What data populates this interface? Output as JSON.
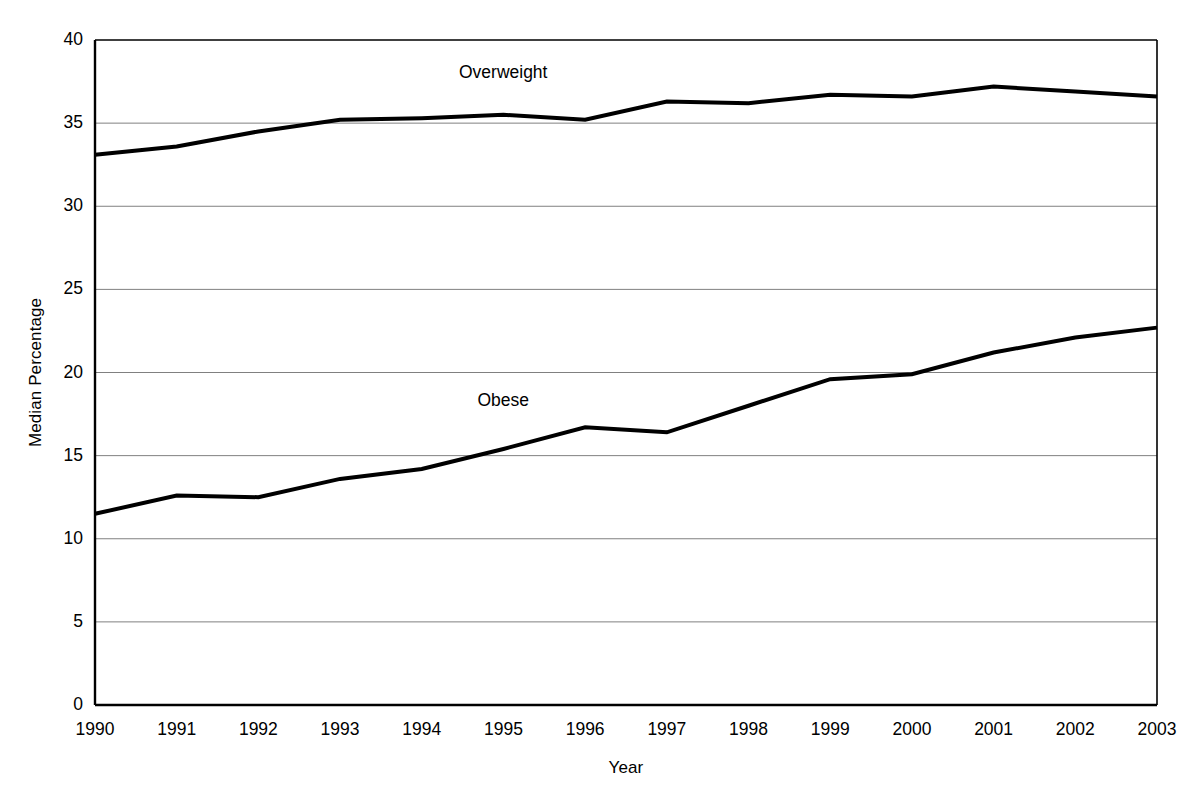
{
  "chart_data": {
    "type": "line",
    "title": "",
    "subtitle": "",
    "xlabel": "Year",
    "ylabel": "Median Percentage",
    "x": [
      1990,
      1991,
      1992,
      1993,
      1994,
      1995,
      1996,
      1997,
      1998,
      1999,
      2000,
      2001,
      2002,
      2003
    ],
    "categories": [
      "1990",
      "1991",
      "1992",
      "1993",
      "1994",
      "1995",
      "1996",
      "1997",
      "1998",
      "1999",
      "2000",
      "2001",
      "2002",
      "2003"
    ],
    "series": [
      {
        "name": "Overweight",
        "values": [
          33.1,
          33.6,
          34.5,
          35.2,
          35.3,
          35.5,
          35.2,
          36.3,
          36.2,
          36.7,
          36.6,
          37.2,
          36.9,
          36.6
        ],
        "color": "#000000",
        "label_x": 1995.0,
        "label_y": 38.0
      },
      {
        "name": "Obese",
        "values": [
          11.5,
          12.6,
          12.5,
          13.6,
          14.2,
          15.4,
          16.7,
          16.4,
          18.0,
          19.6,
          19.9,
          21.2,
          22.1,
          22.7
        ],
        "color": "#000000",
        "label_x": 1995.0,
        "label_y": 18.3
      }
    ],
    "ylim": [
      0,
      40
    ],
    "yticks": [
      0,
      5,
      10,
      15,
      20,
      25,
      30,
      35,
      40
    ],
    "ytick_labels": [
      "0",
      "5",
      "10",
      "15",
      "20",
      "25",
      "30",
      "35",
      "40"
    ],
    "xlim": [
      1990,
      2003
    ],
    "grid": "horizontal",
    "grid_color": "#808080",
    "legend": "inline-annotations",
    "axis_color": "#000000",
    "background": "#ffffff",
    "line_width": 4
  }
}
